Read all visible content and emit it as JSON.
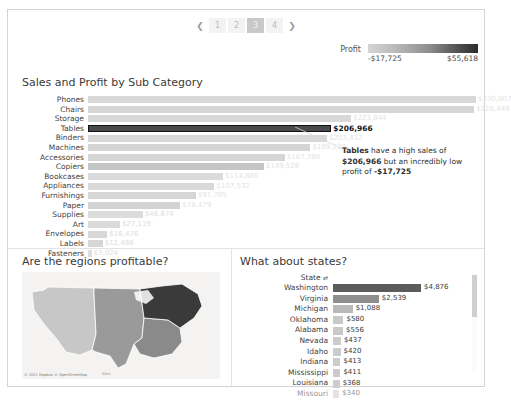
{
  "pagination": {
    "prev_icon": "chevron-left-icon",
    "next_icon": "chevron-right-icon",
    "pages": [
      "1",
      "2",
      "3",
      "4"
    ],
    "selected": "3"
  },
  "legend": {
    "title": "Profit",
    "min_label": "-$17,725",
    "max_label": "$55,618",
    "gradient_low_color": "#d5d5d5",
    "gradient_high_color": "#2b2b2b"
  },
  "panels": {
    "bar_title": "Sales and Profit by Sub Category",
    "map_title": "Are the regions profitable?",
    "states_title": "What about states?"
  },
  "annotation": {
    "part1_bold": "Tables",
    "part2": " have a high sales of ",
    "part3_bold": "$206,966",
    "part4": " but an incredibly low profit of ",
    "part5_bold": "-$17,725"
  },
  "map": {
    "attribution": "© 2021 Mapbox © OpenStreetMap",
    "scale": "50mi"
  },
  "states_table": {
    "header_label": "State",
    "header_sort_icon": "sort-icon",
    "scrollbar_icon": "vertical-scrollbar"
  },
  "chart_data": [
    {
      "type": "bar",
      "title": "Sales and Profit by Sub Category",
      "xlabel": "",
      "ylabel": "Sub-Category",
      "orientation": "horizontal",
      "value_prefix": "$",
      "color_encoding": "Profit",
      "categories": [
        "Phones",
        "Chairs",
        "Storage",
        "Tables",
        "Binders",
        "Machines",
        "Accessories",
        "Copiers",
        "Bookcases",
        "Appliances",
        "Furnishings",
        "Paper",
        "Supplies",
        "Art",
        "Envelopes",
        "Labels",
        "Fasteners"
      ],
      "values": [
        330007,
        328449,
        223844,
        206966,
        203412,
        189239,
        167380,
        149528,
        114880,
        107532,
        91705,
        78479,
        46674,
        27119,
        16476,
        12486,
        3024
      ],
      "value_labels": [
        "$330,007",
        "$328,449",
        "$223,844",
        "$206,966",
        "$203,412",
        "$189,239",
        "$167,380",
        "$149,528",
        "$114,880",
        "$107,532",
        "$91,705",
        "$78,479",
        "$46,674",
        "$27,119",
        "$16,476",
        "$12,486",
        "$3,024"
      ],
      "profit_color": [
        "#d9d9d9",
        "#d6d6d6",
        "#d8d8d8",
        "#4a4a4a",
        "#d7d7d7",
        "#d4d4d4",
        "#d6d6d6",
        "#c6c6c6",
        "#dbdbdb",
        "#d9d9d9",
        "#d6d6d6",
        "#d3d3d3",
        "#dcdcdc",
        "#dadada",
        "#d8d8d8",
        "#d6d6d6",
        "#dedede"
      ],
      "highlighted": "Tables",
      "xlim": [
        0,
        330007
      ],
      "grid": false
    },
    {
      "type": "bar",
      "title": "What about states?",
      "orientation": "horizontal",
      "value_prefix": "$",
      "categories": [
        "Washington",
        "Virginia",
        "Michigan",
        "Oklahoma",
        "Alabama",
        "Nevada",
        "Idaho",
        "Indiana",
        "Mississippi",
        "Louisiana",
        "Missouri"
      ],
      "values": [
        4876,
        2539,
        1088,
        580,
        556,
        437,
        420,
        413,
        411,
        368,
        340
      ],
      "value_labels": [
        "$4,876",
        "$2,539",
        "$1,088",
        "$580",
        "$556",
        "$437",
        "$420",
        "$413",
        "$411",
        "$368",
        "$340"
      ],
      "bar_color": [
        "#5c5c5c",
        "#8e8e8e",
        "#b9b9b9",
        "#c9c9c9",
        "#c9c9c9",
        "#cccccc",
        "#cccccc",
        "#cccccc",
        "#cccccc",
        "#cdcdcd",
        "#cdcdcd"
      ],
      "xlim": [
        0,
        4876
      ],
      "grid": false
    },
    {
      "type": "map",
      "title": "Are the regions profitable?",
      "regions": [
        "West",
        "Central",
        "South",
        "East"
      ],
      "region_colors": [
        "#c7c7c7",
        "#9a9a9a",
        "#8a8a8a",
        "#3a3a3a"
      ]
    }
  ]
}
